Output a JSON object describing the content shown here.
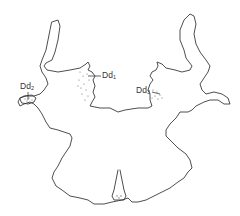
{
  "figure": {
    "type": "inkblot-location-diagram",
    "labels": [
      {
        "id": "dd1",
        "text": "Dd",
        "subscript": "1"
      },
      {
        "id": "dd2",
        "text": "Dd",
        "subscript": "2"
      },
      {
        "id": "dd3",
        "text": "Dd",
        "subscript": "3"
      }
    ],
    "colors": {
      "outline": "#3a3a3a",
      "stipple": "#6a6a6a",
      "background": "#ffffff"
    }
  }
}
